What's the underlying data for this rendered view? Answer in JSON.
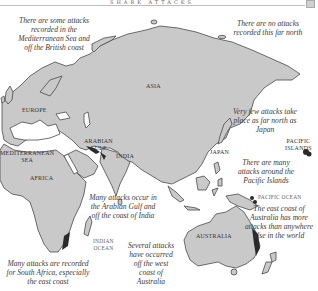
{
  "header": {
    "title": "SHARK ATTACKS"
  },
  "colors": {
    "land": "#c9c9c9",
    "coast": "#4a4a4a",
    "attack_zone": "#2a2a2a",
    "sea": "#ffffff",
    "text": "#3c3c3c"
  },
  "regions": {
    "europe": "Europe",
    "asia": "Asia",
    "africa": "Africa",
    "india": "India",
    "japan": "Japan",
    "australia": "Australia",
    "arabian_gulf_line1": "Arabian",
    "arabian_gulf_line2": "Gulf",
    "mediterranean_line1": "Mediterranean",
    "mediterranean_line2": "Sea",
    "pacific_islands_line1": "Pacific",
    "pacific_islands_line2": "Islands",
    "indian_ocean_line1": "Indian",
    "indian_ocean_line2": "Ocean",
    "pacific_ocean": "Pacific Ocean"
  },
  "notes": {
    "mediterranean": "There are some attacks recorded in the Mediterranean Sea and off the British coast",
    "far_north": "There are no attacks recorded this far north",
    "japan": "Very few attacks take place as far north as Japan",
    "pacific_islands": "There are many attacks around the Pacific Islands",
    "arabian_gulf": "Many attacks occur in the Arabian Gulf and off the coast of India",
    "australia_east": "The east coast of Australia has more attacks than anywhere else in the world",
    "australia_west": "Several attacks have occurred off the west coast of Australia",
    "south_africa": "Many attacks are recorded for South Africa, especially the east coast"
  }
}
